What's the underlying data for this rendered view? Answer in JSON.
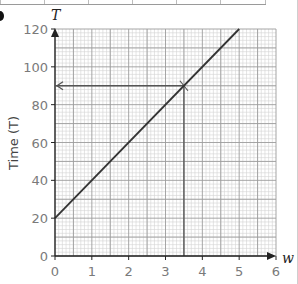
{
  "chart_data": {
    "type": "line",
    "title": "",
    "xlabel": "w",
    "ylabel": "Time (T)",
    "y_axis_letter": "T",
    "x_axis_letter": "w",
    "xlim": [
      0,
      6
    ],
    "ylim": [
      0,
      120
    ],
    "x_ticks": [
      0,
      1,
      2,
      3,
      4,
      5,
      6
    ],
    "y_ticks": [
      0,
      20,
      40,
      60,
      80,
      100,
      120
    ],
    "grid": true,
    "grid_minor_divisions": 5,
    "legend": null,
    "series": [
      {
        "name": "T = 20w + 20",
        "x": [
          0,
          5
        ],
        "y": [
          20,
          120
        ]
      }
    ],
    "annotations": [
      {
        "type": "vertical-guide",
        "x": 3.5,
        "from_y": 0,
        "to_y": 90
      },
      {
        "type": "horizontal-guide-arrow",
        "y": 90,
        "from_x": 3.5,
        "to_x": 0,
        "arrow_at": "y-axis"
      }
    ]
  },
  "labels": {
    "y_letter": "T",
    "x_letter": "w",
    "y_title": "Time (T)",
    "y_ticks": [
      "0",
      "20",
      "40",
      "60",
      "80",
      "100",
      "120"
    ],
    "x_ticks": [
      "0",
      "1",
      "2",
      "3",
      "4",
      "5",
      "6"
    ]
  },
  "colors": {
    "minor_grid": "#d4d4d4",
    "major_grid": "#9c9c9c",
    "line": "#333333",
    "axis": "#222222"
  }
}
